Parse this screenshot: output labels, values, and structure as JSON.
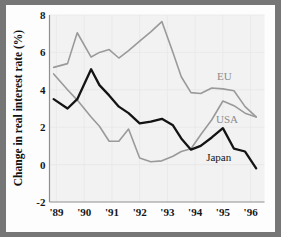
{
  "chart_data": {
    "type": "line",
    "title": "",
    "xlabel": "",
    "ylabel": "Change in real interest rate (%)",
    "ylim": [
      -2,
      8
    ],
    "yticks": [
      -2,
      0,
      2,
      4,
      6,
      8
    ],
    "ytick_labels": [
      "-2",
      "0",
      "2",
      "4",
      "6",
      "8"
    ],
    "xlim": [
      1988.75,
      1996.5
    ],
    "xticks": [
      1989,
      1990,
      1991,
      1992,
      1993,
      1994,
      1995,
      1996
    ],
    "xtick_labels": [
      "'89",
      "'90",
      "'91",
      "'92",
      "'93",
      "'94",
      "'95",
      "'96"
    ],
    "grid": true,
    "legend_position": "inline-right",
    "series": [
      {
        "name": "EU",
        "color": "#9a9a9a",
        "label_x": 1995.05,
        "label_y": 4.55,
        "x": [
          1988.9,
          1989.4,
          1989.75,
          1990.25,
          1990.55,
          1990.9,
          1991.25,
          1991.6,
          1992.0,
          1992.4,
          1992.8,
          1993.2,
          1993.5,
          1993.85,
          1994.2,
          1994.6,
          1995.0,
          1995.4,
          1995.8,
          1996.2
        ],
        "values": [
          5.2,
          5.4,
          7.05,
          5.75,
          6.0,
          6.15,
          5.7,
          6.1,
          6.6,
          7.1,
          7.65,
          6.0,
          4.7,
          3.85,
          3.8,
          4.1,
          4.05,
          3.95,
          3.1,
          2.55
        ]
      },
      {
        "name": "USA",
        "color": "#9a9a9a",
        "label_x": 1995.15,
        "label_y": 2.2,
        "x": [
          1988.9,
          1989.4,
          1989.75,
          1990.25,
          1990.55,
          1990.9,
          1991.25,
          1991.6,
          1992.0,
          1992.4,
          1992.8,
          1993.2,
          1993.5,
          1993.85,
          1994.2,
          1994.6,
          1995.0,
          1995.4,
          1995.8,
          1996.2
        ],
        "values": [
          4.85,
          4.0,
          3.45,
          2.55,
          2.05,
          1.25,
          1.25,
          1.9,
          0.35,
          0.15,
          0.2,
          0.45,
          0.7,
          0.85,
          1.6,
          2.4,
          3.4,
          3.15,
          2.75,
          2.55
        ]
      },
      {
        "name": "Japan",
        "color": "#141414",
        "label_x": 1994.85,
        "label_y": 0.2,
        "x": [
          1988.9,
          1989.4,
          1989.75,
          1990.25,
          1990.55,
          1990.9,
          1991.25,
          1991.6,
          1992.0,
          1992.4,
          1992.8,
          1993.2,
          1993.5,
          1993.85,
          1994.2,
          1994.6,
          1995.0,
          1995.4,
          1995.8,
          1996.2
        ],
        "values": [
          3.5,
          3.0,
          3.5,
          5.1,
          4.25,
          3.7,
          3.1,
          2.75,
          2.2,
          2.3,
          2.45,
          2.1,
          1.4,
          0.8,
          1.0,
          1.45,
          1.95,
          0.85,
          0.7,
          -0.2
        ]
      }
    ]
  },
  "axis": {
    "y_title": "Change in real interest rate (%)"
  }
}
